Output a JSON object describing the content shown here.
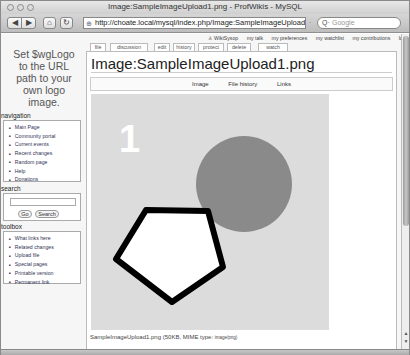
{
  "browser": {
    "window_title": "Image:SampleImageUpload1.png - ProfWikis - MySQL",
    "url": "http://choate.local/mysql/index.php/Image:SampleImageUpload1.png",
    "search_placeholder": "Google",
    "buttons": {
      "back": "◀",
      "forward": "▶",
      "home": "⌂",
      "reload": "↻",
      "add": "+"
    }
  },
  "personal_tools": [
    "WikiSysop",
    "my talk",
    "my preferences",
    "my watchlist",
    "my contributions",
    "log out"
  ],
  "tabs": [
    "file",
    "discussion",
    "edit",
    "history",
    "protect",
    "delete",
    "watch"
  ],
  "logo_text": [
    "Set $wgLogo",
    "to the URL",
    "path to your",
    "own logo",
    "image."
  ],
  "navigation": {
    "title": "navigation",
    "items": [
      "Main Page",
      "Community portal",
      "Current events",
      "Recent changes",
      "Random page",
      "Help",
      "Donations"
    ]
  },
  "search": {
    "title": "search",
    "go_label": "Go",
    "search_label": "Search",
    "value": ""
  },
  "toolbox": {
    "title": "toolbox",
    "items": [
      "What links here",
      "Related changes",
      "Upload file",
      "Special pages",
      "Printable version",
      "Permanent link"
    ]
  },
  "page": {
    "title": "Image:SampleImageUpload1.png",
    "file_toc": [
      "Image",
      "File history",
      "Links"
    ],
    "image": {
      "label": "1",
      "background": "#dcdcdc",
      "circle_color": "#8a8a8a",
      "pentagon_fill": "#ffffff",
      "pentagon_stroke": "#000000"
    },
    "caption": {
      "filename": "SampleImageUpload1.png",
      "size": "(50KB, MIME type:",
      "mime": "image/png)"
    }
  }
}
